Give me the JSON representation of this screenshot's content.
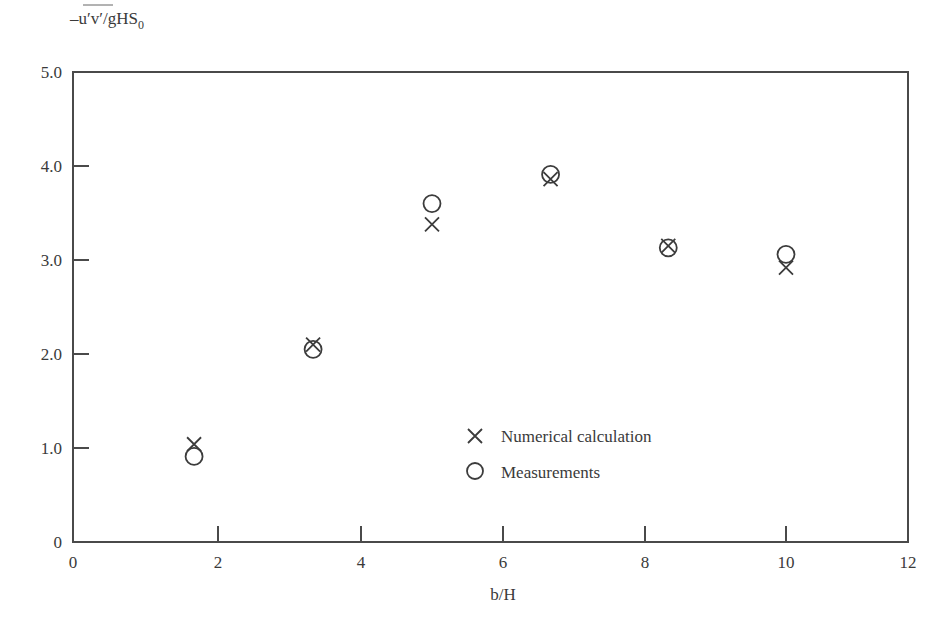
{
  "chart_data": {
    "type": "scatter",
    "title": "",
    "xlabel": "b/H",
    "ylabel": "-u'v'/gHS0",
    "ylabel_parts": {
      "prefix": "–u′v′",
      "mid": "/gHS",
      "sub": "0"
    },
    "xlim": [
      0,
      12
    ],
    "ylim": [
      0,
      5.0
    ],
    "x_ticks": [
      0,
      2,
      4,
      6,
      8,
      10,
      12
    ],
    "x_tick_labels": [
      "0",
      "2",
      "4",
      "6",
      "8",
      "10",
      "12"
    ],
    "y_ticks": [
      0,
      1.0,
      2.0,
      3.0,
      4.0,
      5.0
    ],
    "y_tick_labels": [
      "0",
      "1.0",
      "2.0",
      "3.0",
      "4.0",
      "5.0"
    ],
    "grid": false,
    "legend_position": "lower center (inside)",
    "series": [
      {
        "name": "Numerical calculation",
        "marker": "x",
        "x": [
          1.67,
          3.33,
          5.0,
          6.67,
          8.33,
          10.0
        ],
        "y": [
          1.04,
          2.1,
          3.38,
          3.86,
          3.15,
          2.92
        ]
      },
      {
        "name": "Measurements",
        "marker": "o",
        "x": [
          1.67,
          3.33,
          5.0,
          6.67,
          8.33,
          10.0
        ],
        "y": [
          0.91,
          2.05,
          3.6,
          3.91,
          3.13,
          3.06
        ]
      }
    ]
  },
  "colors": {
    "axis": "#4a4a4a",
    "marker": "#3c3c3c",
    "text": "#3a3a3a"
  }
}
